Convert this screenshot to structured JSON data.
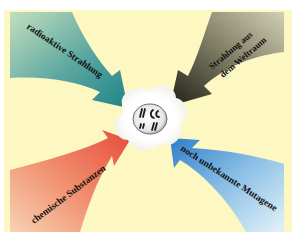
{
  "diagram": {
    "title": "Mutagene",
    "background_color": "#fdf7c2",
    "center": {
      "label": "Zellkern mit Chromosomen",
      "glyphs": [
        "ʼʼ",
        "ᴗ",
        "ʼʼ",
        "ᴗ"
      ]
    },
    "arrows": [
      {
        "id": "top-left",
        "label": "radioaktive Strahlung",
        "color_start": "#b7d8b8",
        "color_end": "#2f8f8f",
        "points_to": "center"
      },
      {
        "id": "top-right",
        "label_line1": "Strahlung aus",
        "label_line2": "dem Weltraum",
        "color_start": "#c8c5a6",
        "color_end": "#2e2e24",
        "points_to": "center"
      },
      {
        "id": "bottom-left",
        "label": "chemische Substanzen",
        "color_start": "#f6c9a8",
        "color_end": "#ea5a45",
        "points_to": "center"
      },
      {
        "id": "bottom-right",
        "label": "noch unbekannte Mutagene",
        "color_start": "#dceef8",
        "color_end": "#3a88d0",
        "points_to": "center"
      }
    ]
  }
}
